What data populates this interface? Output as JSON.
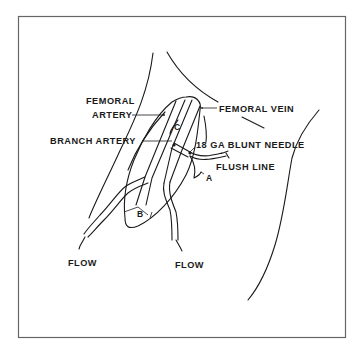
{
  "figure": {
    "type": "anatomical schematic",
    "frame_color": "#666666",
    "line_color": "#1a1a1a",
    "background": "#ffffff"
  },
  "labels": {
    "femoral_artery_line1": "FEMORAL",
    "femoral_artery_line2": "ARTERY",
    "femoral_vein": "FEMORAL VEIN",
    "branch_artery": "BRANCH ARTERY",
    "needle": "18 GA BLUNT NEEDLE",
    "flush_line": "FLUSH LINE",
    "marker_a": "A",
    "marker_b": "B",
    "marker_c": "C",
    "flow_left": "FLOW",
    "flow_right": "FLOW"
  }
}
